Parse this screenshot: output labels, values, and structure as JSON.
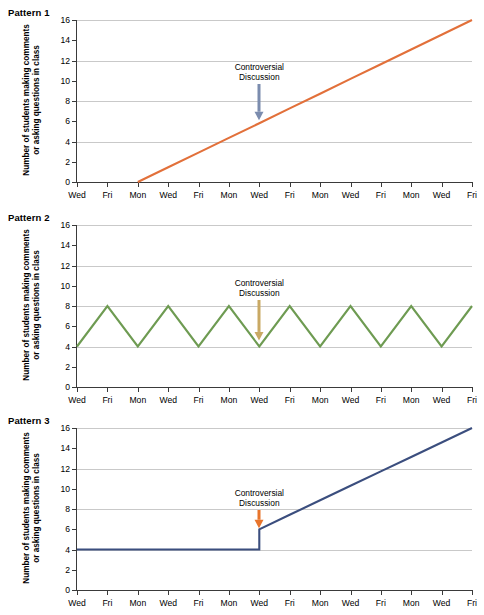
{
  "figure": {
    "panels": [
      {
        "title": "Pattern 1",
        "ylabel_line1": "Number of students making comments",
        "ylabel_line2": "or asking questions in class",
        "annotation_line1": "Controversial",
        "annotation_line2": "Discussion",
        "line_color": "#E2703A",
        "arrow_color": "#7B8CAE"
      },
      {
        "title": "Pattern 2",
        "ylabel_line1": "Number of students making comments",
        "ylabel_line2": "or asking questions in class",
        "annotation_line1": "Controversial",
        "annotation_line2": "Discussion",
        "line_color": "#6E9B52",
        "arrow_color": "#C9A964"
      },
      {
        "title": "Pattern 3",
        "ylabel_line1": "Number of students making comments",
        "ylabel_line2": "or asking questions in class",
        "annotation_line1": "Controversial",
        "annotation_line2": "Discussion",
        "line_color": "#3B4E7E",
        "arrow_color": "#E8742B"
      }
    ]
  },
  "chart_data": [
    {
      "type": "line",
      "title": "Pattern 1",
      "xlabel": "",
      "ylabel": "Number of students making comments or asking questions in class",
      "categories": [
        "Wed",
        "Fri",
        "Mon",
        "Wed",
        "Fri",
        "Mon",
        "Wed",
        "Fri",
        "Mon",
        "Wed",
        "Fri",
        "Mon",
        "Wed",
        "Fri"
      ],
      "x": [
        0,
        1,
        2,
        3,
        4,
        5,
        6,
        7,
        8,
        9,
        10,
        11,
        12,
        13
      ],
      "values": [
        null,
        null,
        0,
        1.45,
        2.9,
        4.36,
        5.81,
        7.27,
        8.72,
        10.18,
        11.63,
        13.09,
        14.54,
        16
      ],
      "ylim": [
        0,
        16
      ],
      "yticks": [
        0,
        2,
        4,
        6,
        8,
        10,
        12,
        14,
        16
      ],
      "gridlines": [
        4,
        8,
        12,
        16
      ],
      "grid": true,
      "legend": "none",
      "series_color": "#E2703A",
      "annotations": [
        {
          "text": "Controversial Discussion",
          "at_category": "Wed",
          "at_x": 6,
          "arrow_points_to_y": 6,
          "arrow_color": "#7B8CAE"
        }
      ]
    },
    {
      "type": "line",
      "title": "Pattern 2",
      "xlabel": "",
      "ylabel": "Number of students making comments or asking questions in class",
      "categories": [
        "Wed",
        "Fri",
        "Mon",
        "Wed",
        "Fri",
        "Mon",
        "Wed",
        "Fri",
        "Mon",
        "Wed",
        "Fri",
        "Mon",
        "Wed",
        "Fri"
      ],
      "x": [
        0,
        1,
        2,
        3,
        4,
        5,
        6,
        7,
        8,
        9,
        10,
        11,
        12,
        13
      ],
      "values": [
        4,
        8,
        4,
        8,
        4,
        8,
        4,
        8,
        4,
        8,
        4,
        8,
        4,
        8
      ],
      "ylim": [
        0,
        16
      ],
      "yticks": [
        0,
        2,
        4,
        6,
        8,
        10,
        12,
        14,
        16
      ],
      "gridlines": [
        4,
        8,
        12,
        16
      ],
      "grid": true,
      "legend": "none",
      "series_color": "#6E9B52",
      "annotations": [
        {
          "text": "Controversial Discussion",
          "at_category": "Wed",
          "at_x": 6,
          "arrow_points_to_y": 4.5,
          "arrow_color": "#C9A964"
        }
      ]
    },
    {
      "type": "line",
      "title": "Pattern 3",
      "xlabel": "",
      "ylabel": "Number of students making comments or asking questions in class",
      "categories": [
        "Wed",
        "Fri",
        "Mon",
        "Wed",
        "Fri",
        "Mon",
        "Wed",
        "Fri",
        "Mon",
        "Wed",
        "Fri",
        "Mon",
        "Wed",
        "Fri"
      ],
      "x": [
        0,
        1,
        2,
        3,
        4,
        5,
        6,
        7,
        8,
        9,
        10,
        11,
        12,
        13
      ],
      "values": [
        4,
        4,
        4,
        4,
        4,
        4,
        6,
        7.43,
        8.86,
        10.29,
        11.71,
        13.14,
        14.57,
        16
      ],
      "step_at_x": 6,
      "step_from": 4,
      "step_to": 6,
      "ylim": [
        0,
        16
      ],
      "yticks": [
        0,
        2,
        4,
        6,
        8,
        10,
        12,
        14,
        16
      ],
      "gridlines": [
        4,
        8,
        12,
        16
      ],
      "grid": true,
      "legend": "none",
      "series_color": "#3B4E7E",
      "annotations": [
        {
          "text": "Controversial Discussion",
          "at_category": "Wed",
          "at_x": 6,
          "arrow_points_to_y": 6,
          "arrow_color": "#E8742B"
        }
      ]
    }
  ]
}
